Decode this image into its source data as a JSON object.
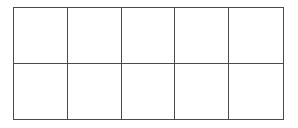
{
  "grid": {
    "rows": 2,
    "columns": 5,
    "line_color": "#4a4a4a",
    "background": "#ffffff",
    "cells": [
      [
        "",
        "",
        "",
        "",
        ""
      ],
      [
        "",
        "",
        "",
        "",
        ""
      ]
    ]
  }
}
